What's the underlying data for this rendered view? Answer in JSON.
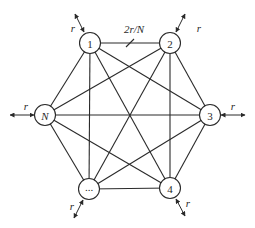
{
  "diagram": {
    "type": "complete-graph",
    "nodes": [
      {
        "id": "1",
        "label": "1",
        "italic": false,
        "x": 90,
        "y": 43,
        "rate_label": "r",
        "arrow": {
          "x1": 84,
          "y1": 32,
          "x2": 75,
          "y2": 14
        },
        "label_pos": {
          "x": 73,
          "y": 28
        }
      },
      {
        "id": "2",
        "label": "2",
        "italic": false,
        "x": 170,
        "y": 43,
        "rate_label": "r",
        "arrow": {
          "x1": 176,
          "y1": 32,
          "x2": 185,
          "y2": 14
        },
        "label_pos": {
          "x": 199,
          "y": 28
        }
      },
      {
        "id": "3",
        "label": "3",
        "italic": false,
        "x": 210,
        "y": 115,
        "rate_label": "r",
        "arrow": {
          "x1": 221,
          "y1": 115,
          "x2": 245,
          "y2": 115
        },
        "label_pos": {
          "x": 233,
          "y": 106
        }
      },
      {
        "id": "4",
        "label": "4",
        "italic": false,
        "x": 170,
        "y": 188,
        "rate_label": "r",
        "arrow": {
          "x1": 176,
          "y1": 199,
          "x2": 185,
          "y2": 216
        },
        "label_pos": {
          "x": 188,
          "y": 203
        }
      },
      {
        "id": "dots",
        "label": "...",
        "italic": false,
        "x": 89,
        "y": 189,
        "rate_label": "r",
        "arrow": {
          "x1": 83,
          "y1": 200,
          "x2": 74,
          "y2": 218
        },
        "label_pos": {
          "x": 72,
          "y": 206
        }
      },
      {
        "id": "N",
        "label": "N",
        "italic": true,
        "x": 45,
        "y": 115,
        "rate_label": "r",
        "arrow": {
          "x1": 34,
          "y1": 115,
          "x2": 10,
          "y2": 115
        },
        "label_pos": {
          "x": 26,
          "y": 106
        }
      }
    ],
    "edges": [
      [
        "1",
        "2"
      ],
      [
        "1",
        "3"
      ],
      [
        "1",
        "4"
      ],
      [
        "1",
        "dots"
      ],
      [
        "1",
        "N"
      ],
      [
        "2",
        "3"
      ],
      [
        "2",
        "4"
      ],
      [
        "2",
        "dots"
      ],
      [
        "2",
        "N"
      ],
      [
        "3",
        "4"
      ],
      [
        "3",
        "dots"
      ],
      [
        "3",
        "N"
      ],
      [
        "4",
        "dots"
      ],
      [
        "4",
        "N"
      ],
      [
        "dots",
        "N"
      ]
    ],
    "link_rate_label": "2r/N",
    "link_rate_label_pos": {
      "x": 134,
      "y": 33
    },
    "link_tick": {
      "x1": 126,
      "y1": 47,
      "x2": 134,
      "y2": 39
    }
  }
}
